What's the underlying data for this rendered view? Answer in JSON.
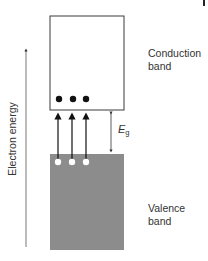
{
  "diagram": {
    "axis": {
      "label": "Electron energy",
      "direction": "up"
    },
    "conduction_band": {
      "label_line1": "Conduction",
      "label_line2": "band",
      "fill": "#ffffff",
      "stroke": "#3a3a3a"
    },
    "valence_band": {
      "label_line1": "Valence",
      "label_line2": "band",
      "fill": "#8c8c8c"
    },
    "band_gap": {
      "symbol": "E",
      "subscript": "g"
    },
    "electrons": {
      "count": 3,
      "color": "#111111"
    },
    "holes": {
      "count": 3,
      "color": "#ffffff"
    },
    "transitions": {
      "count": 3,
      "color": "#111111"
    }
  }
}
